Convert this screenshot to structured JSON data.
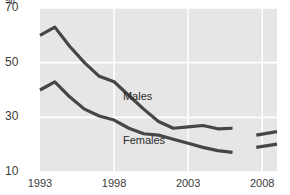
{
  "chart_data": {
    "type": "line",
    "title": "",
    "subtitle": "",
    "xlabel": "",
    "ylabel": "",
    "unit_symbol": "%",
    "xlim": [
      1993,
      2009
    ],
    "ylim": [
      10,
      70
    ],
    "grid": true,
    "gridlines_y": [
      10,
      30,
      50,
      70
    ],
    "gridlines_x": [
      1998,
      2003,
      2008
    ],
    "ytick_labels": [
      "10",
      "30",
      "50",
      "70"
    ],
    "ytick_values": [
      10,
      30,
      50,
      70
    ],
    "xtick_labels": [
      "1993",
      "1998",
      "2003",
      "2008"
    ],
    "xtick_values": [
      1993,
      1998,
      2003,
      2008
    ],
    "legend_position": "inline-annotation",
    "series": [
      {
        "name": "Males",
        "color": "#464646",
        "label_x": 1998.6,
        "label_y": 37.5,
        "x": [
          1993,
          1994,
          1995,
          1996,
          1997,
          1998,
          1999,
          2000,
          2001,
          2002,
          2003,
          2004,
          2005,
          2006
        ],
        "values": [
          60.0,
          63.0,
          56.0,
          50.0,
          45.0,
          43.0,
          38.0,
          33.0,
          28.5,
          26.0,
          26.5,
          27.0,
          25.8,
          26.0
        ],
        "break_after": 2006,
        "resume_segment": {
          "x": [
            2007.6,
            2009.0
          ],
          "values": [
            23.5,
            24.8
          ]
        }
      },
      {
        "name": "Females",
        "color": "#464646",
        "label_x": 1998.6,
        "label_y": 21.5,
        "x": [
          1993,
          1994,
          1995,
          1996,
          1997,
          1998,
          1999,
          2000,
          2001,
          2002,
          2003,
          2004,
          2005,
          2006
        ],
        "values": [
          40.0,
          43.0,
          37.5,
          33.0,
          30.5,
          29.0,
          26.0,
          24.0,
          23.5,
          22.0,
          20.5,
          19.0,
          17.8,
          17.2
        ],
        "break_after": 2006,
        "resume_segment": {
          "x": [
            2007.6,
            2009.0
          ],
          "values": [
            19.0,
            20.2
          ]
        }
      }
    ],
    "colors": {
      "plot_background": "#e6e6e6",
      "gridline": "#ffffff",
      "line": "#464646",
      "text": "#3b3b3b",
      "page_background": "#ffffff"
    }
  }
}
